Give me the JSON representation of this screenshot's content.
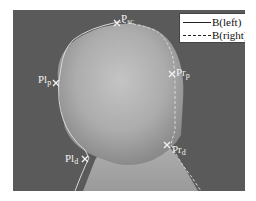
{
  "figure": {
    "colors": {
      "background": "#5a5a5a",
      "head": "#b8b8b8",
      "boundary": "#d8d8d8",
      "marker": "#f2f2f2"
    }
  },
  "legend": {
    "items": [
      {
        "label": "B(left)",
        "style": "solid"
      },
      {
        "label": "B(right)",
        "style": "dashed"
      }
    ]
  },
  "landmarks": [
    {
      "name": "P",
      "sub": "sc",
      "position": "top"
    },
    {
      "name": "Pl",
      "sub": "p",
      "position": "left-upper"
    },
    {
      "name": "Pr",
      "sub": "p",
      "position": "right-upper"
    },
    {
      "name": "Pl",
      "sub": "d",
      "position": "left-lower"
    },
    {
      "name": "Pr",
      "sub": "d",
      "position": "right-lower"
    }
  ]
}
